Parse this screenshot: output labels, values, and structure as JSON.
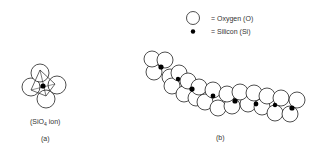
{
  "legend": {
    "oxygen_label": "= Oxygen (O)",
    "silicon_label": "= Silicon (Si)"
  },
  "panel_a": {
    "label_prefix": "(SiO",
    "label_sub": "4",
    "label_suffix": " ion)",
    "caption": "(a)"
  },
  "panel_b": {
    "caption": "(b)"
  },
  "colors": {
    "stroke": "#222222",
    "silicon": "#000000",
    "oxygen_fill": "#ffffff"
  }
}
